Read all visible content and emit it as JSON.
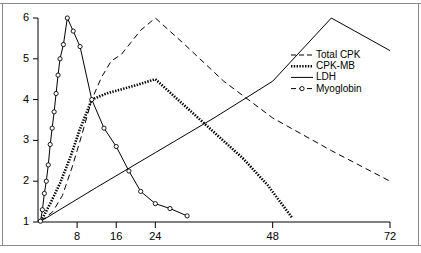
{
  "figure": {
    "background_color": "#ffffff",
    "frame_color": "#8a8a8a",
    "ink_color": "#000000"
  },
  "axes": {
    "y_ticks": [
      "6",
      "5",
      "4",
      "3",
      "2",
      "1"
    ],
    "x_ticks": [
      "8",
      "16",
      "24",
      "48",
      "72"
    ]
  },
  "legend": {
    "entries": [
      {
        "label": "Total CPK",
        "style": "dashed"
      },
      {
        "label": "CPK-MB",
        "style": "dotted-thick"
      },
      {
        "label": "LDH",
        "style": "solid"
      },
      {
        "label": "Myoglobin",
        "style": "circle-marker-dashed"
      }
    ]
  },
  "chart_data": {
    "type": "line",
    "title": "",
    "subtitle": "",
    "xlabel": "",
    "ylabel": "",
    "xlim": [
      0,
      72
    ],
    "ylim": [
      1,
      6
    ],
    "xticks": [
      8,
      16,
      24,
      48,
      72
    ],
    "yticks": [
      1,
      2,
      3,
      4,
      5,
      6
    ],
    "grid": false,
    "legend_position": "right",
    "series": [
      {
        "name": "Total CPK",
        "style": "dashed",
        "color": "#000000",
        "markers": false,
        "x": [
          0.6,
          3.0,
          5.0,
          7.0,
          9.0,
          11.0,
          13.0,
          15.0,
          17.0,
          19.0,
          21.0,
          24.0,
          30.0,
          38.0,
          48.0,
          60.0,
          72.0
        ],
        "y": [
          1.02,
          1.25,
          1.65,
          2.35,
          3.15,
          4.0,
          4.55,
          4.95,
          5.1,
          5.4,
          5.7,
          6.0,
          5.35,
          4.45,
          3.55,
          2.75,
          2.0
        ]
      },
      {
        "name": "CPK-MB",
        "style": "dotted-thick",
        "color": "#000000",
        "markers": false,
        "x": [
          0.6,
          2.5,
          4.5,
          6.5,
          8.5,
          11.0,
          14.0,
          17.0,
          20.0,
          24.0,
          30.0,
          36.0,
          42.0,
          47.0,
          52.0
        ],
        "y": [
          1.02,
          1.45,
          1.95,
          2.55,
          3.25,
          4.0,
          4.15,
          4.25,
          4.35,
          4.5,
          3.85,
          3.2,
          2.55,
          1.9,
          1.1
        ]
      },
      {
        "name": "LDH",
        "style": "solid",
        "color": "#000000",
        "markers": false,
        "x": [
          0.6,
          12.0,
          24.0,
          36.0,
          48.0,
          60.0,
          72.0
        ],
        "y": [
          1.02,
          1.85,
          2.7,
          3.55,
          4.45,
          6.0,
          5.2
        ]
      },
      {
        "name": "Myoglobin",
        "style": "circle-marker-dashed",
        "color": "#000000",
        "markers": true,
        "x": [
          0.5,
          0.9,
          1.3,
          1.7,
          2.1,
          2.5,
          2.9,
          3.3,
          3.7,
          4.1,
          4.5,
          5.2,
          6.0,
          7.2,
          8.6,
          11.0,
          13.5,
          16.0,
          18.6,
          21.0,
          24.0,
          27.0,
          30.5
        ],
        "y": [
          1.02,
          1.3,
          1.7,
          2.0,
          2.4,
          2.9,
          3.3,
          3.7,
          4.15,
          4.6,
          5.0,
          5.35,
          6.0,
          5.68,
          5.3,
          4.0,
          3.3,
          2.85,
          2.25,
          1.75,
          1.45,
          1.33,
          1.15
        ]
      }
    ]
  }
}
